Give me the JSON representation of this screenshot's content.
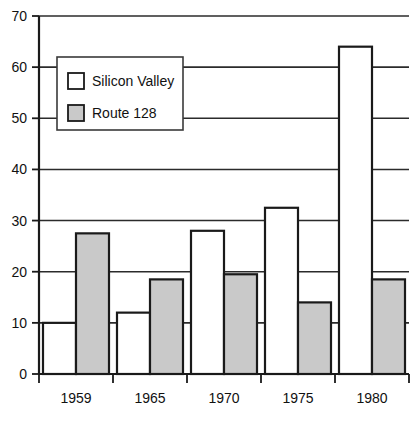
{
  "chart_data": {
    "type": "bar",
    "title": "",
    "subtitle": "",
    "xlabel": "",
    "ylabel": "",
    "categories": [
      "1959",
      "1965",
      "1970",
      "1975",
      "1980"
    ],
    "series": [
      {
        "name": "Silicon  Valley",
        "values": [
          10,
          12,
          28,
          32.5,
          64
        ]
      },
      {
        "name": "Route  128",
        "values": [
          27.5,
          18.5,
          19.5,
          14,
          18.5
        ]
      }
    ],
    "ylim": [
      0,
      70
    ],
    "yticks": [
      0,
      10,
      20,
      30,
      40,
      50,
      60,
      70
    ],
    "ytick_labels": [
      "0",
      "10",
      "20",
      "30",
      "40",
      "50",
      "60",
      "70"
    ],
    "grid": true,
    "grid_axis": "y",
    "legend_position": "upper-left-inside",
    "legend": [
      {
        "label": "Silicon  Valley",
        "swatch": "white-square"
      },
      {
        "label": "Route  128",
        "swatch": "gray-square"
      }
    ],
    "colors": {
      "silicon_valley_fill": "#ffffff",
      "route_128_fill": "#c9c9c9",
      "stroke": "#1a1a1a",
      "gridline": "#2b2b2b",
      "background": "#ffffff",
      "text": "#111111"
    }
  }
}
